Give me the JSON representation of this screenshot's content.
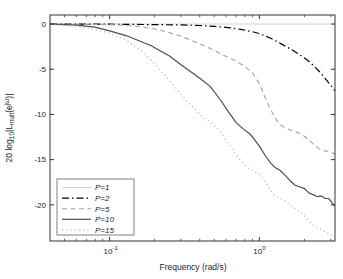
{
  "figure": {
    "background": "#ffffff",
    "axis_color": "#333333",
    "text_color": "#262626",
    "legend_border_color": "#808080",
    "legend_background": "#ffffff"
  },
  "chart_data": {
    "type": "line",
    "title": "",
    "xlabel": "Frequency (rad/s)",
    "ylabel": "20 log10|L_mult(e^jw)|",
    "ylabel_parts": [
      {
        "t": "20 log",
        "s": "n"
      },
      {
        "t": "10",
        "s": "sub"
      },
      {
        "t": "|L",
        "s": "n"
      },
      {
        "t": "mult",
        "s": "sub"
      },
      {
        "t": "(e",
        "s": "n"
      },
      {
        "t": "jω",
        "s": "sup"
      },
      {
        "t": ")|",
        "s": "n"
      }
    ],
    "xscale": "log",
    "xlim": [
      0.04,
      3.2
    ],
    "ylim": [
      -24,
      1
    ],
    "grid": false,
    "xticks": [
      {
        "value": 0.1,
        "base": "10",
        "exp": "-1"
      },
      {
        "value": 1.0,
        "base": "10",
        "exp": "0"
      }
    ],
    "xminorticks": [
      0.05,
      0.06,
      0.07,
      0.08,
      0.09,
      0.2,
      0.3,
      0.4,
      0.5,
      0.6,
      0.7,
      0.8,
      0.9,
      2,
      3
    ],
    "yticks": [
      {
        "value": 0,
        "label": "0"
      },
      {
        "value": -5,
        "label": "-5"
      },
      {
        "value": -10,
        "label": "-10"
      },
      {
        "value": -15,
        "label": "-15"
      },
      {
        "value": -20,
        "label": "-20"
      }
    ],
    "legend": {
      "position": "lower-left"
    },
    "series": [
      {
        "name": "P=1",
        "style": "solid",
        "color": "#d2d2d2",
        "width": 1,
        "points": [
          [
            0.04,
            0
          ],
          [
            3.2,
            0
          ]
        ]
      },
      {
        "name": "P=2",
        "style": "dashdot",
        "color": "#000000",
        "width": 1.2,
        "points": [
          [
            0.04,
            0
          ],
          [
            0.1,
            -0.02
          ],
          [
            0.2,
            -0.06
          ],
          [
            0.3,
            -0.1
          ],
          [
            0.4,
            -0.16
          ],
          [
            0.5,
            -0.25
          ],
          [
            0.6,
            -0.36
          ],
          [
            0.75,
            -0.58
          ],
          [
            0.9,
            -0.85
          ],
          [
            1.0,
            -1.05
          ],
          [
            1.2,
            -1.6
          ],
          [
            1.4,
            -2.2
          ],
          [
            1.65,
            -2.85
          ],
          [
            1.9,
            -3.5
          ],
          [
            2.1,
            -4.0
          ],
          [
            2.3,
            -4.6
          ],
          [
            2.5,
            -5.2
          ],
          [
            2.75,
            -6.0
          ],
          [
            3.0,
            -6.8
          ],
          [
            3.2,
            -7.4
          ]
        ]
      },
      {
        "name": "P=5",
        "style": "dashed",
        "color": "#a3a3a3",
        "width": 1.1,
        "points": [
          [
            0.04,
            0
          ],
          [
            0.1,
            -0.06
          ],
          [
            0.13,
            -0.16
          ],
          [
            0.16,
            -0.3
          ],
          [
            0.2,
            -0.55
          ],
          [
            0.25,
            -0.95
          ],
          [
            0.3,
            -1.35
          ],
          [
            0.35,
            -1.8
          ],
          [
            0.4,
            -2.2
          ],
          [
            0.5,
            -2.9
          ],
          [
            0.6,
            -3.6
          ],
          [
            0.7,
            -4.1
          ],
          [
            0.8,
            -4.7
          ],
          [
            0.9,
            -5.4
          ],
          [
            1.0,
            -6.6
          ],
          [
            1.1,
            -8.2
          ],
          [
            1.2,
            -9.6
          ],
          [
            1.3,
            -10.6
          ],
          [
            1.4,
            -11.2
          ],
          [
            1.5,
            -11.5
          ],
          [
            1.65,
            -11.8
          ],
          [
            1.8,
            -12.0
          ],
          [
            1.95,
            -12.3
          ],
          [
            2.1,
            -12.7
          ],
          [
            2.3,
            -13.3
          ],
          [
            2.5,
            -13.8
          ],
          [
            2.7,
            -14.0
          ],
          [
            2.9,
            -14.1
          ],
          [
            3.05,
            -14.2
          ],
          [
            3.2,
            -14.4
          ]
        ]
      },
      {
        "name": "P=10",
        "style": "solid",
        "color": "#4d4d4d",
        "width": 1.2,
        "points": [
          [
            0.04,
            -0.02
          ],
          [
            0.06,
            -0.12
          ],
          [
            0.08,
            -0.35
          ],
          [
            0.1,
            -0.75
          ],
          [
            0.13,
            -1.3
          ],
          [
            0.16,
            -1.9
          ],
          [
            0.19,
            -2.4
          ],
          [
            0.22,
            -3.0
          ],
          [
            0.25,
            -3.5
          ],
          [
            0.3,
            -4.5
          ],
          [
            0.35,
            -5.3
          ],
          [
            0.4,
            -6.0
          ],
          [
            0.47,
            -6.9
          ],
          [
            0.55,
            -8.4
          ],
          [
            0.62,
            -9.7
          ],
          [
            0.7,
            -10.9
          ],
          [
            0.78,
            -11.6
          ],
          [
            0.87,
            -12.2
          ],
          [
            0.95,
            -13.0
          ],
          [
            1.0,
            -13.5
          ],
          [
            1.1,
            -14.6
          ],
          [
            1.18,
            -15.3
          ],
          [
            1.28,
            -15.9
          ],
          [
            1.38,
            -16.2
          ],
          [
            1.5,
            -16.8
          ],
          [
            1.62,
            -17.4
          ],
          [
            1.72,
            -17.8
          ],
          [
            1.85,
            -18.0
          ],
          [
            2.0,
            -18.2
          ],
          [
            2.15,
            -18.7
          ],
          [
            2.3,
            -18.9
          ],
          [
            2.45,
            -19.1
          ],
          [
            2.6,
            -19.0
          ],
          [
            2.75,
            -19.3
          ],
          [
            2.9,
            -19.3
          ],
          [
            3.0,
            -19.6
          ],
          [
            3.1,
            -19.9
          ],
          [
            3.2,
            -20.1
          ]
        ]
      },
      {
        "name": "P=15",
        "style": "dotted",
        "color": "#c2c2c2",
        "width": 1.3,
        "points": [
          [
            0.04,
            -0.05
          ],
          [
            0.06,
            -0.25
          ],
          [
            0.08,
            -0.6
          ],
          [
            0.1,
            -1.0
          ],
          [
            0.13,
            -1.8
          ],
          [
            0.16,
            -2.9
          ],
          [
            0.19,
            -4.0
          ],
          [
            0.22,
            -5.2
          ],
          [
            0.25,
            -6.2
          ],
          [
            0.28,
            -7.2
          ],
          [
            0.32,
            -8.3
          ],
          [
            0.37,
            -9.4
          ],
          [
            0.42,
            -10.3
          ],
          [
            0.47,
            -10.8
          ],
          [
            0.55,
            -11.9
          ],
          [
            0.62,
            -13.2
          ],
          [
            0.7,
            -14.5
          ],
          [
            0.79,
            -15.6
          ],
          [
            0.89,
            -16.2
          ],
          [
            1.0,
            -16.6
          ],
          [
            1.1,
            -17.5
          ],
          [
            1.24,
            -18.9
          ],
          [
            1.35,
            -19.2
          ],
          [
            1.5,
            -19.6
          ],
          [
            1.62,
            -20.1
          ],
          [
            1.75,
            -20.5
          ],
          [
            1.93,
            -20.9
          ],
          [
            2.1,
            -21.6
          ],
          [
            2.25,
            -22.2
          ],
          [
            2.45,
            -22.6
          ],
          [
            2.6,
            -22.7
          ],
          [
            2.8,
            -23.1
          ],
          [
            3.0,
            -23.3
          ],
          [
            3.2,
            -23.6
          ]
        ]
      }
    ]
  }
}
